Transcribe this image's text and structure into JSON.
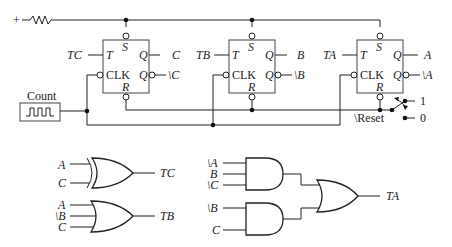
{
  "supply": {
    "label": "+"
  },
  "clock_source": {
    "label": "Count"
  },
  "flip_flops": [
    {
      "id": "C",
      "t_input": "TC",
      "set": "S",
      "reset": "R",
      "toggle": "T",
      "clk": "CLK",
      "q": "Q",
      "qn": "Q",
      "out": "C",
      "out_n": "\\C"
    },
    {
      "id": "B",
      "t_input": "TB",
      "set": "S",
      "reset": "R",
      "toggle": "T",
      "clk": "CLK",
      "q": "Q",
      "qn": "Q",
      "out": "B",
      "out_n": "\\B"
    },
    {
      "id": "A",
      "t_input": "TA",
      "set": "S",
      "reset": "R",
      "toggle": "T",
      "clk": "CLK",
      "q": "Q",
      "qn": "Q",
      "out": "A",
      "out_n": "\\A"
    }
  ],
  "reset_switch": {
    "label": "\\Reset",
    "high": "1",
    "low": "0"
  },
  "logic": {
    "tc_gate": {
      "type": "XOR",
      "inputs": [
        "A",
        "C"
      ],
      "output": "TC"
    },
    "tb_gate": {
      "type": "OR",
      "inputs": [
        "A",
        "\\B",
        "C"
      ],
      "output": "TB"
    },
    "ta_and1": {
      "type": "AND",
      "inputs": [
        "\\A",
        "B",
        "\\C"
      ]
    },
    "ta_and2": {
      "type": "AND",
      "inputs": [
        "\\B",
        "C"
      ]
    },
    "ta_or": {
      "type": "OR",
      "output": "TA"
    }
  },
  "colors": {
    "line": "#222222",
    "background": "#ffffff"
  }
}
